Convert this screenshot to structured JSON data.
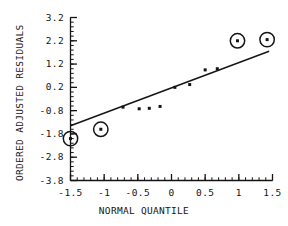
{
  "chart_data": {
    "type": "scatter",
    "title": "",
    "xlabel": "NORMAL QUANTILE",
    "ylabel": "ORDERED ADJUSTED RESIDUALS",
    "xlim": [
      -1.5,
      1.5
    ],
    "ylim": [
      -3.8,
      3.2
    ],
    "grid": false,
    "legend": "none",
    "x_ticks": [
      -1.5,
      -1,
      -0.5,
      0,
      0.5,
      1,
      1.5
    ],
    "x_tick_labels": [
      "-1.5",
      "-1",
      "-0.5",
      "0",
      "0.5",
      "1",
      "1.5"
    ],
    "x_minor_step": 0.1,
    "y_ticks": [
      3.2,
      2.2,
      1.2,
      0.2,
      -0.8,
      -1.8,
      -2.8,
      -3.8
    ],
    "y_tick_labels": [
      "3.2",
      "2.2",
      "1.2",
      "0.2",
      "-0.8",
      "-1.8",
      "-2.8",
      "-3.8"
    ],
    "y_minor_step": 0.2,
    "series": [
      {
        "name": "residual-points",
        "marker": "square-dot",
        "points": [
          {
            "x": -0.72,
            "y": -0.65
          },
          {
            "x": -0.48,
            "y": -0.72
          },
          {
            "x": -0.33,
            "y": -0.7
          },
          {
            "x": -0.17,
            "y": -0.62
          },
          {
            "x": 0.05,
            "y": 0.2
          },
          {
            "x": 0.27,
            "y": 0.32
          },
          {
            "x": 0.5,
            "y": 0.95
          },
          {
            "x": 0.68,
            "y": 1.0
          }
        ]
      },
      {
        "name": "circled-outliers",
        "marker": "circled-dot",
        "points": [
          {
            "x": -1.5,
            "y": -2.0
          },
          {
            "x": -1.05,
            "y": -1.6
          },
          {
            "x": 0.98,
            "y": 2.2
          },
          {
            "x": 1.42,
            "y": 2.25
          }
        ]
      }
    ],
    "reference_line": {
      "name": "fitted-line",
      "x1": -1.5,
      "y1": -1.45,
      "x2": 1.45,
      "y2": 1.75
    },
    "colors": {
      "axis": "#141414",
      "marker": "#141414",
      "line": "#141414",
      "background": "#ffffff"
    }
  }
}
